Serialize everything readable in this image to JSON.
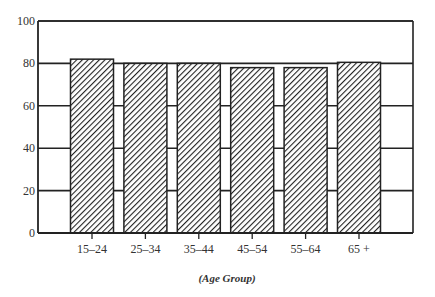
{
  "chart_data": {
    "type": "bar",
    "title": "",
    "xlabel": "(Age Group)",
    "ylabel": "",
    "categories": [
      "15–24",
      "25–34",
      "35–44",
      "45–54",
      "55–64",
      "65 +"
    ],
    "values": [
      82,
      80,
      80,
      78,
      78,
      80.5
    ],
    "ylim": [
      0,
      100
    ],
    "yticks": [
      0,
      20,
      40,
      60,
      80,
      100
    ],
    "grid": true,
    "legend": null,
    "bar_fill": "diagonal hatch (black on white)",
    "colors": {
      "axis": "#222222",
      "grid": "#222222",
      "hatch": "#222222",
      "bar_bg": "#ffffff"
    }
  }
}
